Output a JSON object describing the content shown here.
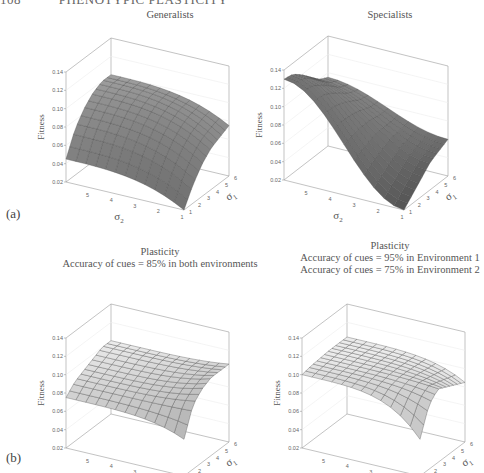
{
  "page_header": {
    "page_number": "108",
    "running_title": "PHENOTYPIC PLASTICITY"
  },
  "sections": [
    {
      "label": "(a)"
    },
    {
      "label": "(b)"
    }
  ],
  "panels": [
    {
      "id": "generalists",
      "title_lines": [
        "Generalists"
      ]
    },
    {
      "id": "specialists",
      "title_lines": [
        "Specialists"
      ]
    },
    {
      "id": "plasticity-85",
      "title_lines": [
        "Plasticity",
        "Accuracy of cues = 85% in both environments"
      ]
    },
    {
      "id": "plasticity-95-75",
      "title_lines": [
        "Plasticity",
        "Accuracy of cues = 95% in Environment 1",
        "Accuracy of cues = 75% in Environment 2"
      ]
    }
  ],
  "axes": {
    "z_label": "Fitness",
    "x_label": "σ2",
    "y_label": "σ1",
    "z_ticks": [
      "0.02",
      "0.04",
      "0.06",
      "0.08",
      "0.10",
      "0.12",
      "0.14"
    ],
    "x_ticks": [
      "5",
      "4",
      "3",
      "2",
      "1"
    ],
    "y_ticks": [
      "1",
      "2",
      "3",
      "4",
      "5",
      "6"
    ]
  },
  "chart_data": [
    {
      "type": "surface",
      "title": "Generalists",
      "xlabel": "σ2",
      "ylabel": "σ1",
      "zlabel": "Fitness",
      "x_range": [
        1,
        6
      ],
      "y_range": [
        1,
        6
      ],
      "zlim": [
        0.02,
        0.14
      ],
      "description": "Broad plateau ~0.10 at high σ1 and σ2; drops to ~0.04-0.05 at the low-σ edges and ~0.02 near σ1=σ2=1",
      "grid_z_samples": {
        "sigma2_at_6": [
          0.045,
          0.07,
          0.085,
          0.095,
          0.1,
          0.1
        ],
        "sigma2_at_1": [
          0.02,
          0.04,
          0.055,
          0.065,
          0.07,
          0.075
        ]
      },
      "surface_color": "#8a8a8a"
    },
    {
      "type": "surface",
      "title": "Specialists",
      "xlabel": "σ2",
      "ylabel": "σ1",
      "zlabel": "Fitness",
      "x_range": [
        1,
        6
      ],
      "y_range": [
        1,
        6
      ],
      "zlim": [
        0.02,
        0.14
      ],
      "description": "Saddle-shaped: high (~0.13) at high σ2 / low σ1, falling to ~0.02 at σ2=1 and ~0.06 at high σ1",
      "grid_z_samples": {
        "sigma2_at_6": [
          0.13,
          0.128,
          0.12,
          0.11,
          0.1,
          0.095
        ],
        "sigma2_at_1": [
          0.02,
          0.03,
          0.04,
          0.05,
          0.055,
          0.06
        ]
      },
      "surface_color": "#6e6e6e"
    },
    {
      "type": "surface",
      "title": "Plasticity — Accuracy of cues = 85% in both environments",
      "xlabel": "σ2",
      "ylabel": "σ1",
      "zlabel": "Fitness",
      "x_range": [
        1,
        6
      ],
      "y_range": [
        1,
        6
      ],
      "zlim": [
        0.02,
        0.14
      ],
      "description": "Gently varying surface ~0.08-0.11 with a dip toward ~0.06 near σ1=σ2=1",
      "grid_z_samples": {
        "sigma2_at_6": [
          0.075,
          0.085,
          0.09,
          0.095,
          0.1,
          0.1
        ],
        "sigma2_at_1": [
          0.06,
          0.09,
          0.1,
          0.105,
          0.105,
          0.105
        ]
      },
      "surface_color": "#d6d6d6"
    },
    {
      "type": "surface",
      "title": "Plasticity — Accuracy of cues = 95% in Environment 1, 75% in Environment 2",
      "xlabel": "σ2",
      "ylabel": "σ1",
      "zlabel": "Fitness",
      "x_range": [
        1,
        6
      ],
      "y_range": [
        1,
        6
      ],
      "zlim": [
        0.02,
        0.14
      ],
      "description": "Ridge ~0.10-0.12 at low σ1, descending to ~0.06 near σ2=1 and ~0.08 at high σ1",
      "grid_z_samples": {
        "sigma2_at_6": [
          0.1,
          0.102,
          0.103,
          0.104,
          0.104,
          0.104
        ],
        "sigma2_at_1": [
          0.06,
          0.09,
          0.1,
          0.095,
          0.09,
          0.085
        ]
      },
      "surface_color": "#e0e0e0"
    }
  ]
}
